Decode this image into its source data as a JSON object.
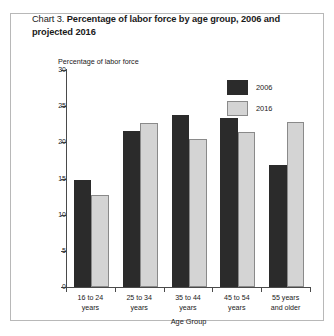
{
  "title": {
    "label": "Chart 3.",
    "main": "Percentage of labor force by age group, 2006 and projected 2016"
  },
  "chart_data": {
    "type": "bar",
    "title": "Chart 3. Percentage of labor force by age group, 2006 and projected 2016",
    "xlabel": "Age Group",
    "ylabel": "Percentage of labor force",
    "categories": [
      "16 to 24 years",
      "25 to 34 years",
      "35 to 44 years",
      "45 to 54 years",
      "55 years and older"
    ],
    "category_lines": [
      [
        "16 to 24",
        "years"
      ],
      [
        "25 to 34",
        "years"
      ],
      [
        "35 to 44",
        "years"
      ],
      [
        "45 to 54",
        "years"
      ],
      [
        "55 years",
        "and older"
      ]
    ],
    "series": [
      {
        "name": "2006",
        "color": "#2b2b2b",
        "values": [
          14.8,
          21.5,
          23.8,
          23.3,
          16.9
        ]
      },
      {
        "name": "2016",
        "color": "#d4d4d4",
        "values": [
          12.7,
          22.7,
          20.5,
          21.4,
          22.8
        ]
      }
    ],
    "ylim": [
      0,
      30
    ],
    "yticks": [
      0,
      5,
      10,
      15,
      20,
      25,
      30
    ],
    "ytick_labels": [
      "0",
      "5",
      "10",
      "15",
      "20",
      "25",
      "30"
    ],
    "grid": false,
    "legend_position": "top-right"
  },
  "legend": {
    "entries": [
      {
        "label": "2006"
      },
      {
        "label": "2016"
      }
    ]
  }
}
